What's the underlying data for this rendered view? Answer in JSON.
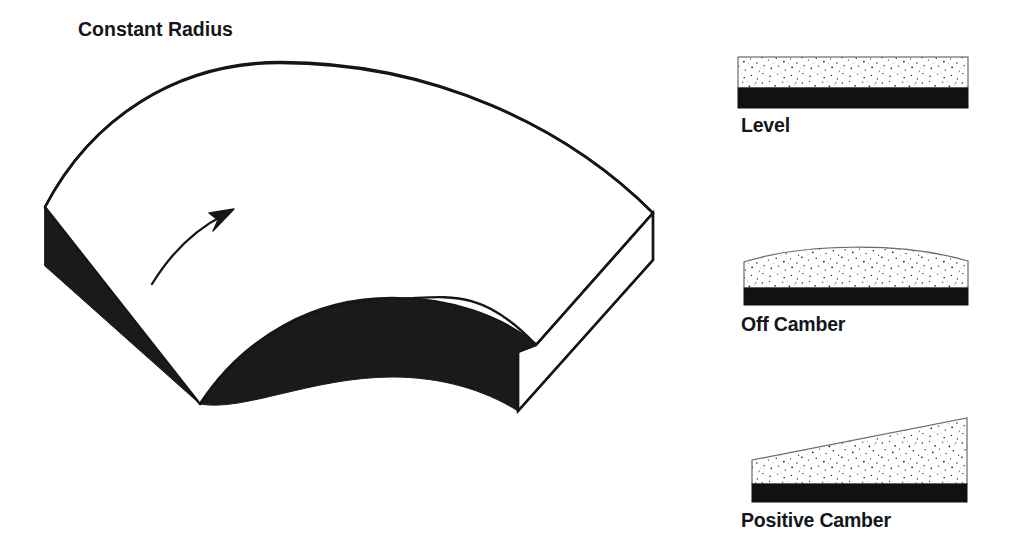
{
  "figure": {
    "title": "Constant Radius",
    "type": "technical-line-diagram",
    "background_color": "#ffffff",
    "ink_color": "#15161a"
  },
  "main_diagram": {
    "name": "constant-radius-curve",
    "title": "Constant Radius",
    "description_parts": {
      "top_surface": "white-road-surface",
      "side_wall": "solid-black-extruded-edge",
      "end_face": "white-outlined-cross-section",
      "direction_arrow": "curved-travel-direction-arrow"
    },
    "fill_top": "#ffffff",
    "fill_side": "#1a1a1a",
    "stroke": "#15161a"
  },
  "cross_sections": [
    {
      "id": "level",
      "label": "Level",
      "profile": "flat",
      "surface_fill": "stipple",
      "base_fill": "#111111",
      "geometry": {
        "left": 738,
        "right": 968,
        "top_left_y": 57,
        "top_right_y": 57,
        "surface_bottom_y": 88,
        "base_bottom_y": 108
      }
    },
    {
      "id": "off-camber",
      "label": "Off Camber",
      "profile": "crowned",
      "surface_fill": "stipple",
      "base_fill": "#111111",
      "geometry": {
        "left": 744,
        "right": 968,
        "top_left_y": 262,
        "top_crown_y": 246,
        "top_right_y": 261,
        "surface_bottom_y": 288,
        "base_bottom_y": 305
      }
    },
    {
      "id": "positive-camber",
      "label": "Positive Camber",
      "profile": "banked-rising-right",
      "surface_fill": "stipple",
      "base_fill": "#111111",
      "geometry": {
        "left": 752,
        "right": 967,
        "top_left_y": 460,
        "top_right_y": 418,
        "surface_bottom_y": 484,
        "base_bottom_y": 502
      }
    }
  ]
}
